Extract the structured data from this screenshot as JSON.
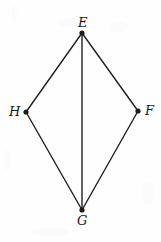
{
  "figure": {
    "name": "kite-efgh-diagram",
    "type": "geometry-quadrilateral",
    "canvas": {
      "width": 161,
      "height": 242
    },
    "style": {
      "background_color": "#fefefe",
      "stroke_color": "#231f20",
      "stroke_width": 1.4,
      "vertex_dot_color": "#1c1c1c",
      "vertex_dot_radius": 2.6,
      "label_color": "#1c1c1c"
    },
    "vertices": [
      {
        "id": "E",
        "label": "E",
        "x": 82,
        "y": 33,
        "label_x": 78,
        "label_y": 16,
        "position": "top"
      },
      {
        "id": "F",
        "label": "F",
        "x": 138,
        "y": 111,
        "label_x": 145,
        "label_y": 104,
        "position": "right"
      },
      {
        "id": "G",
        "label": "G",
        "x": 82,
        "y": 210,
        "label_x": 77,
        "label_y": 214,
        "position": "bottom"
      },
      {
        "id": "H",
        "label": "H",
        "x": 26,
        "y": 112,
        "label_x": 9,
        "label_y": 105,
        "position": "left"
      }
    ],
    "edges": [
      {
        "id": "EH",
        "from": "E",
        "to": "H",
        "kind": "side"
      },
      {
        "id": "EF",
        "from": "E",
        "to": "F",
        "kind": "side"
      },
      {
        "id": "HG",
        "from": "H",
        "to": "G",
        "kind": "side"
      },
      {
        "id": "FG",
        "from": "F",
        "to": "G",
        "kind": "side"
      },
      {
        "id": "EG",
        "from": "E",
        "to": "G",
        "kind": "diagonal"
      }
    ]
  }
}
